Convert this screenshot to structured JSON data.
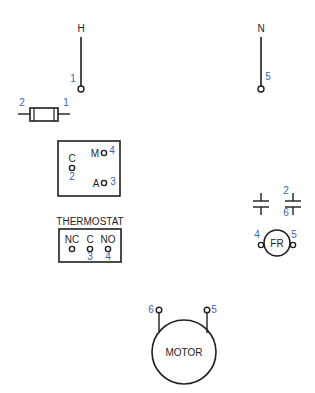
{
  "colors": {
    "line": "#1e1e1e",
    "terminal_number": "#3a62b8",
    "background": "#ffffff"
  },
  "supply": {
    "hot": {
      "label": "H",
      "terminal": "1"
    },
    "neutral": {
      "label": "N",
      "terminal": "5"
    }
  },
  "fuse": {
    "left_terminal": "2",
    "right_terminal": "1"
  },
  "selector_switch": {
    "common_label": "C",
    "common_terminal": "2",
    "manual_label": "M",
    "manual_terminal": "4",
    "auto_label": "A",
    "auto_terminal": "3"
  },
  "thermostat": {
    "title": "THERMOSTAT",
    "nc_label": "NC",
    "c_label": "C",
    "no_label": "NO",
    "c_terminal": "3",
    "no_terminal": "4"
  },
  "relay_contact": {
    "top_terminal": "2",
    "bottom_terminal": "6"
  },
  "fan_relay_coil": {
    "label": "FR",
    "left_terminal": "4",
    "right_terminal": "5"
  },
  "motor": {
    "label": "MOTOR",
    "left_terminal": "6",
    "right_terminal": "5"
  }
}
